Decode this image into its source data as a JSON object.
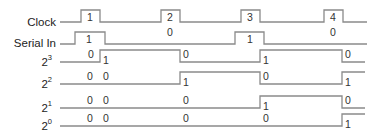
{
  "diagram": {
    "type": "timing-diagram",
    "line_color": "#8a8a8a",
    "text_color": "#222222",
    "signals": [
      {
        "id": "clock",
        "label": "Clock",
        "sup": "",
        "label_x": 56,
        "label_y": 26,
        "lead": [
          60,
          81
        ],
        "y_low": 22,
        "y_high": 10,
        "points": [
          [
            60,
            22
          ],
          [
            81,
            22
          ],
          [
            81,
            10
          ],
          [
            100,
            10
          ],
          [
            100,
            22
          ],
          [
            161,
            22
          ],
          [
            161,
            10
          ],
          [
            180,
            10
          ],
          [
            180,
            22
          ],
          [
            241,
            22
          ],
          [
            241,
            10
          ],
          [
            260,
            10
          ],
          [
            260,
            22
          ],
          [
            324,
            22
          ],
          [
            324,
            10
          ],
          [
            343,
            10
          ],
          [
            343,
            22
          ],
          [
            367,
            22
          ]
        ],
        "values": [
          {
            "text": "1",
            "x": 87,
            "y": 21
          },
          {
            "text": "2",
            "x": 167,
            "y": 21
          },
          {
            "text": "3",
            "x": 247,
            "y": 21
          },
          {
            "text": "4",
            "x": 330,
            "y": 21
          }
        ]
      },
      {
        "id": "serial-in",
        "label": "Serial In",
        "sup": "",
        "label_x": 56,
        "label_y": 47,
        "y_low": 44,
        "y_high": 32,
        "points": [
          [
            60,
            44
          ],
          [
            75,
            44
          ],
          [
            75,
            32
          ],
          [
            105,
            32
          ],
          [
            105,
            44
          ],
          [
            235,
            44
          ],
          [
            235,
            32
          ],
          [
            264,
            32
          ],
          [
            264,
            44
          ],
          [
            367,
            44
          ]
        ],
        "values": [
          {
            "text": "1",
            "x": 86,
            "y": 43
          },
          {
            "text": "0",
            "x": 167,
            "y": 36
          },
          {
            "text": "1",
            "x": 247,
            "y": 43
          },
          {
            "text": "0",
            "x": 330,
            "y": 36
          }
        ]
      },
      {
        "id": "bit3",
        "label": "2",
        "sup": "3",
        "label_x": 52,
        "label_y": 66,
        "y_low": 62,
        "y_high": 50,
        "points": [
          [
            60,
            62
          ],
          [
            100,
            62
          ],
          [
            100,
            50
          ],
          [
            180,
            50
          ],
          [
            180,
            62
          ],
          [
            260,
            62
          ],
          [
            260,
            50
          ],
          [
            342,
            50
          ],
          [
            342,
            62
          ],
          [
            365,
            62
          ]
        ],
        "values": [
          {
            "text": "0",
            "x": 88,
            "y": 58
          },
          {
            "text": "1",
            "x": 103,
            "y": 64
          },
          {
            "text": "0",
            "x": 183,
            "y": 58
          },
          {
            "text": "1",
            "x": 263,
            "y": 64
          },
          {
            "text": "0",
            "x": 345,
            "y": 58
          }
        ]
      },
      {
        "id": "bit2",
        "label": "2",
        "sup": "2",
        "label_x": 52,
        "label_y": 88,
        "y_low": 84,
        "y_high": 72,
        "points": [
          [
            60,
            84
          ],
          [
            180,
            84
          ],
          [
            180,
            72
          ],
          [
            260,
            72
          ],
          [
            260,
            84
          ],
          [
            342,
            84
          ],
          [
            342,
            72
          ],
          [
            365,
            72
          ]
        ],
        "values": [
          {
            "text": "0",
            "x": 87,
            "y": 80
          },
          {
            "text": "0",
            "x": 103,
            "y": 80
          },
          {
            "text": "1",
            "x": 183,
            "y": 86
          },
          {
            "text": "0",
            "x": 263,
            "y": 80
          },
          {
            "text": "1",
            "x": 345,
            "y": 86
          }
        ]
      },
      {
        "id": "bit1",
        "label": "2",
        "sup": "1",
        "label_x": 52,
        "label_y": 112,
        "y_low": 108,
        "y_high": 96,
        "points": [
          [
            60,
            108
          ],
          [
            260,
            108
          ],
          [
            260,
            96
          ],
          [
            342,
            96
          ],
          [
            342,
            108
          ],
          [
            365,
            108
          ]
        ],
        "values": [
          {
            "text": "0",
            "x": 87,
            "y": 104
          },
          {
            "text": "0",
            "x": 103,
            "y": 104
          },
          {
            "text": "0",
            "x": 183,
            "y": 104
          },
          {
            "text": "1",
            "x": 263,
            "y": 110
          },
          {
            "text": "0",
            "x": 345,
            "y": 104
          }
        ]
      },
      {
        "id": "bit0",
        "label": "2",
        "sup": "0",
        "label_x": 52,
        "label_y": 130,
        "y_low": 126,
        "y_high": 114,
        "points": [
          [
            60,
            126
          ],
          [
            342,
            126
          ],
          [
            342,
            114
          ],
          [
            365,
            114
          ]
        ],
        "values": [
          {
            "text": "0",
            "x": 87,
            "y": 122
          },
          {
            "text": "0",
            "x": 103,
            "y": 122
          },
          {
            "text": "0",
            "x": 183,
            "y": 122
          },
          {
            "text": "0",
            "x": 263,
            "y": 122
          },
          {
            "text": "1",
            "x": 345,
            "y": 128
          }
        ]
      }
    ]
  }
}
